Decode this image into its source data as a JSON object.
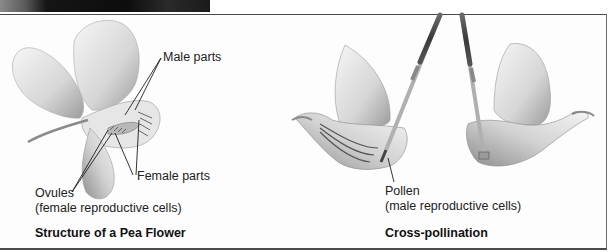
{
  "panels": {
    "left": {
      "caption": "Structure of a Pea Flower",
      "labels": {
        "male_parts": "Male parts",
        "female_parts": "Female parts",
        "ovules": "Ovules",
        "ovules_note": "(female reproductive cells)"
      }
    },
    "right": {
      "caption": "Cross-pollination",
      "labels": {
        "pollen": "Pollen",
        "pollen_note": "(male reproductive cells)"
      }
    }
  },
  "colors": {
    "border": "#4a4a4a",
    "line": "#1e1e1e",
    "petal_light": "#f2f2f2",
    "petal_shade": "#9a9a9a"
  }
}
